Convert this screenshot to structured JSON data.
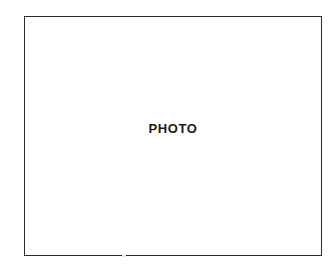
{
  "page": {
    "background_color": "#ffffff",
    "width": 332,
    "height": 271
  },
  "photo_placeholder": {
    "label": "PHOTO",
    "border_color": "#2a2a2a",
    "fill_color": "#ffffff",
    "text_color": "#1c1c1c"
  }
}
